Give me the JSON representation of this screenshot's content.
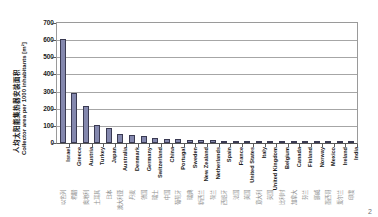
{
  "page": {
    "page_number": "2",
    "background_color": "#ffffff"
  },
  "chart_data": {
    "type": "bar",
    "title": "",
    "xlabel": "",
    "ylabel": "人均太阳能集热器安装面积 Collector area per 1000 inhabitants [m²]",
    "ylabel_cn": "人均太阳能集热器安装面积",
    "ylabel_en": "Collector area per 1000 inhabitants [m²]",
    "unit": "m²",
    "ylim": [
      0,
      700
    ],
    "ytick_step": 100,
    "yticks": [
      700,
      600,
      500,
      400,
      300,
      200,
      100,
      0
    ],
    "grid": true,
    "grid_axis": "y",
    "legend": false,
    "legend_position": "none",
    "bar_color": "#8488ae",
    "bar_edge_color": "#3a3a52",
    "gridline_color": "#a6a6a6",
    "categories": [
      "Israel",
      "Greece",
      "Austria",
      "Turkey",
      "Japan",
      "Australia",
      "Denmark",
      "Germany",
      "Switzerland",
      "China",
      "Portugal",
      "Sweden",
      "New Zealand",
      "Netherlands",
      "Spain",
      "France",
      "United States",
      "Italy",
      "United Kingdom",
      "Belgium",
      "Canada",
      "Finland",
      "Norway",
      "Mexico",
      "Ireland",
      "India"
    ],
    "categories_cn": [
      "以色列",
      "希腊",
      "奥地利",
      "土耳其",
      "日本",
      "澳大利亚",
      "丹麦",
      "德国",
      "瑞士",
      "中国",
      "葡萄牙",
      "瑞典",
      "新西兰",
      "荷兰",
      "西班牙",
      "法国",
      "美国",
      "意大利",
      "英国",
      "比利时",
      "加拿大",
      "芬兰",
      "挪威",
      "墨西哥",
      "爱尔兰",
      "印度"
    ],
    "values": [
      605,
      290,
      215,
      105,
      90,
      55,
      45,
      42,
      32,
      25,
      22,
      20,
      18,
      16,
      14,
      11,
      10,
      9,
      5,
      4,
      3,
      3,
      2,
      2,
      1,
      1
    ]
  }
}
